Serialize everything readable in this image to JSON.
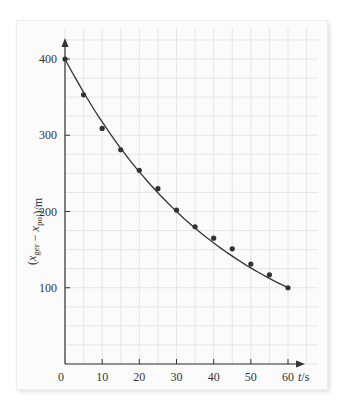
{
  "caption_fragment": "",
  "chart_data": {
    "type": "scatter",
    "title": "",
    "xlabel": "t/s",
    "ylabel": "(x_ger − x_pol)/m",
    "xlim": [
      0,
      60
    ],
    "ylim": [
      0,
      400
    ],
    "xticks": [
      0,
      10,
      20,
      30,
      40,
      50,
      60
    ],
    "yticks": [
      100,
      200,
      300,
      400
    ],
    "grid": true,
    "legend": "none",
    "series": [
      {
        "name": "measured",
        "marker": "dot",
        "x": [
          0,
          5,
          10,
          15,
          20,
          25,
          30,
          35,
          40,
          45,
          50,
          55,
          60
        ],
        "values": [
          400,
          353,
          309,
          281,
          254,
          230,
          202,
          180,
          165,
          151,
          131,
          117,
          100
        ]
      },
      {
        "name": "fit curve",
        "style": "line",
        "x": [
          0,
          5,
          10,
          15,
          20,
          25,
          30,
          35,
          40,
          45,
          50,
          55,
          60
        ],
        "values": [
          400,
          355,
          316,
          283,
          255,
          229,
          206,
          185,
          166,
          148,
          131,
          115,
          100
        ]
      }
    ],
    "colors": {
      "axis": "#333333",
      "data": "#333333",
      "grid": "#e6e6e6",
      "background": "#fbfbfb"
    }
  }
}
